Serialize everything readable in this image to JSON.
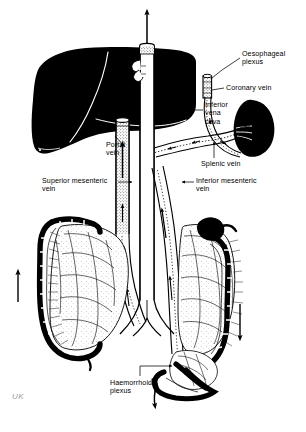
{
  "figure": {
    "background_color": "#ffffff",
    "ink_color": "#000000",
    "signature": "UK"
  },
  "labels": [
    {
      "id": "oesophageal-plexus",
      "text": "Oesophageal\nplexus",
      "x": 242,
      "y": 50,
      "align": "left"
    },
    {
      "id": "coronary-vein",
      "text": "Coronary vein",
      "x": 226,
      "y": 84,
      "align": "left"
    },
    {
      "id": "inferior-vena-cava",
      "text": "Inferior\nvena\ncava",
      "x": 205,
      "y": 101,
      "align": "left"
    },
    {
      "id": "portal-vein",
      "text": "Portal\nvein",
      "x": 106,
      "y": 141,
      "align": "left"
    },
    {
      "id": "splenic-vein",
      "text": "Splenic vein",
      "x": 201,
      "y": 160,
      "align": "left"
    },
    {
      "id": "superior-mesenteric-vein",
      "text": "Superior mesenteric\nvein",
      "x": 42,
      "y": 177,
      "align": "left"
    },
    {
      "id": "inferior-mesenteric-vein",
      "text": "Inferior mesenteric\nvein",
      "x": 196,
      "y": 177,
      "align": "left"
    },
    {
      "id": "haemorrhoid-plexus",
      "text": "Haemorrhoid\nplexus",
      "x": 110,
      "y": 379,
      "align": "left"
    }
  ],
  "structures": [
    {
      "id": "liver",
      "name": "Liver",
      "fill": "solid-black"
    },
    {
      "id": "spleen",
      "name": "Spleen",
      "fill": "solid-black"
    },
    {
      "id": "inferior-vena-cava",
      "name": "Inferior vena cava",
      "fill": "white-tube"
    },
    {
      "id": "oesophagus",
      "name": "Oesophagus",
      "fill": "white-tube"
    },
    {
      "id": "portal-vein",
      "name": "Portal vein",
      "fill": "stippled"
    },
    {
      "id": "splenic-vein",
      "name": "Splenic vein",
      "fill": "stippled"
    },
    {
      "id": "coronary-vein",
      "name": "Coronary vein",
      "fill": "stippled"
    },
    {
      "id": "superior-mesenteric-vein",
      "name": "Superior mesenteric vein",
      "fill": "stippled"
    },
    {
      "id": "inferior-mesenteric-vein",
      "name": "Inferior mesenteric vein",
      "fill": "stippled"
    },
    {
      "id": "ascending-colon",
      "name": "Ascending colon",
      "fill": "outline-haustra"
    },
    {
      "id": "descending-colon",
      "name": "Descending colon",
      "fill": "outline-haustra"
    },
    {
      "id": "rectum",
      "name": "Rectum",
      "fill": "outline-haustra"
    },
    {
      "id": "mesentery",
      "name": "Mesenteric vascular arcades",
      "fill": "line-network"
    }
  ],
  "flow_arrows": [
    {
      "id": "ivc-outflow-arrow",
      "direction": "up",
      "x": 147,
      "y": 28
    },
    {
      "id": "left-colon-flow-arrow",
      "direction": "up",
      "x": 18,
      "y": 288
    },
    {
      "id": "right-colon-flow-arrow",
      "direction": "down",
      "x": 240,
      "y": 322
    },
    {
      "id": "rectal-outflow-arrow",
      "direction": "down",
      "x": 167,
      "y": 398
    },
    {
      "id": "portal-vein-flow-arrow",
      "direction": "up",
      "x": 122,
      "y": 160
    },
    {
      "id": "smv-flow-arrow",
      "direction": "up",
      "x": 131,
      "y": 218
    },
    {
      "id": "imv-flow-arrow",
      "direction": "up",
      "x": 167,
      "y": 215
    }
  ]
}
